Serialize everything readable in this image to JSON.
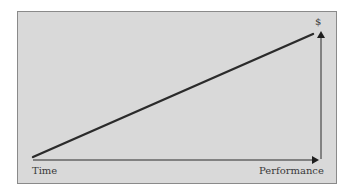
{
  "diagram": {
    "labels": {
      "x_start": "Time",
      "x_end": "Performance",
      "y_end": "$"
    },
    "colors": {
      "background": "#d9d9d9",
      "border": "#8a8a8a",
      "line": "#2b2b2b",
      "text": "#3a3a3a"
    },
    "elements": [
      {
        "type": "trend-line",
        "from": "bottom-left",
        "to": "top-right"
      },
      {
        "type": "x-axis-arrow",
        "direction": "right"
      },
      {
        "type": "y-axis-arrow",
        "direction": "up"
      }
    ]
  }
}
